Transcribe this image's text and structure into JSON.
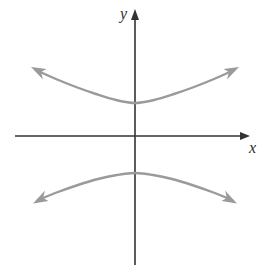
{
  "figure": {
    "width": 269,
    "height": 269,
    "background_color": "#ffffff"
  },
  "axes": {
    "color": "#333333",
    "stroke_width": 1.6,
    "origin": {
      "x": 135,
      "y": 136
    },
    "x_axis": {
      "label": "x",
      "label_style": "italic-serif",
      "start": {
        "x": 15,
        "y": 136
      },
      "end": {
        "x": 250,
        "y": 136
      },
      "arrow": "end"
    },
    "y_axis": {
      "label": "y",
      "label_style": "italic-serif",
      "start": {
        "x": 135,
        "y": 265
      },
      "end": {
        "x": 135,
        "y": 10
      },
      "arrow": "end"
    },
    "ticks": [],
    "tick_labels": [],
    "grid": false
  },
  "chart_data": {
    "type": "line",
    "title": "",
    "xlabel": "x",
    "ylabel": "y",
    "grid": false,
    "legend": null,
    "curve_color": "#9a9a9a",
    "curve_stroke_width": 2.4,
    "arrowheads": 4,
    "equation": "y^2/a^2 - x^2/b^2 = 1",
    "center": {
      "x": 0,
      "y": 0
    },
    "vertices_pixels": [
      {
        "x": 135,
        "y": 103
      },
      {
        "x": 135,
        "y": 173
      }
    ],
    "arrow_tips_pixels": [
      {
        "x": 32,
        "y": 68
      },
      {
        "x": 238,
        "y": 68
      },
      {
        "x": 34,
        "y": 203
      },
      {
        "x": 238,
        "y": 203
      }
    ],
    "series": [
      {
        "name": "upper-branch",
        "opens": "up",
        "points_pixels": [
          {
            "x": 36,
            "y": 70
          },
          {
            "x": 56,
            "y": 79
          },
          {
            "x": 76,
            "y": 87
          },
          {
            "x": 96,
            "y": 94
          },
          {
            "x": 116,
            "y": 100
          },
          {
            "x": 135,
            "y": 103
          },
          {
            "x": 154,
            "y": 100
          },
          {
            "x": 174,
            "y": 94
          },
          {
            "x": 194,
            "y": 87
          },
          {
            "x": 214,
            "y": 79
          },
          {
            "x": 234,
            "y": 70
          }
        ]
      },
      {
        "name": "lower-branch",
        "opens": "down",
        "points_pixels": [
          {
            "x": 38,
            "y": 200
          },
          {
            "x": 58,
            "y": 192
          },
          {
            "x": 78,
            "y": 185
          },
          {
            "x": 98,
            "y": 179
          },
          {
            "x": 117,
            "y": 175
          },
          {
            "x": 135,
            "y": 173
          },
          {
            "x": 153,
            "y": 175
          },
          {
            "x": 172,
            "y": 179
          },
          {
            "x": 192,
            "y": 185
          },
          {
            "x": 212,
            "y": 192
          },
          {
            "x": 232,
            "y": 200
          }
        ]
      }
    ]
  }
}
